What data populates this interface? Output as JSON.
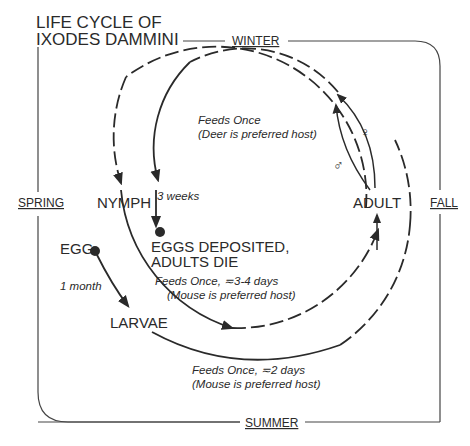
{
  "title": {
    "line1": "LIFE CYCLE OF",
    "line2": "IXODES DAMMINI"
  },
  "seasons": {
    "top": "WINTER",
    "right": "FALL",
    "bottom": "SUMMER",
    "left": "SPRING"
  },
  "stages": {
    "egg": "EGG",
    "larvae": "LARVAE",
    "nymph": "NYMPH",
    "adult": "ADULT",
    "eggs_deposited_line1": "EGGS DEPOSITED,",
    "eggs_deposited_line2": "ADULTS DIE"
  },
  "notes": {
    "egg_to_larvae": "1 month",
    "adult_feed_line1": "Feeds Once",
    "adult_feed_line2": "(Deer is preferred host)",
    "adult_to_eggs": "3 weeks",
    "nymph_feed_line1": "Feeds Once, ≂3-4 days",
    "nymph_feed_line2": "(Mouse is preferred host)",
    "larvae_feed_line1": "Feeds Once, ≂2 days",
    "larvae_feed_line2": "(Mouse is preferred host)"
  },
  "symbols": {
    "female": "♀",
    "male": "♂"
  },
  "colors": {
    "ink": "#2a2a2a",
    "background": "#ffffff"
  }
}
